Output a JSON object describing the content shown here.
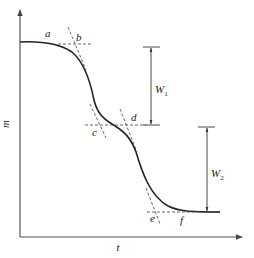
{
  "diagram": {
    "type": "mass-time step curve (two-stage decomposition)",
    "axes": {
      "x_label": "t",
      "y_label": "m"
    },
    "points": {
      "a": "a",
      "b": "b",
      "c": "c",
      "d": "d",
      "e": "e",
      "f": "f"
    },
    "dimensions": {
      "w1": {
        "main": "W",
        "sub": "1"
      },
      "w2": {
        "main": "W",
        "sub": "2"
      }
    },
    "colors": {
      "curve": "#222222",
      "axis": "#555555",
      "background": "#ffffff"
    }
  }
}
